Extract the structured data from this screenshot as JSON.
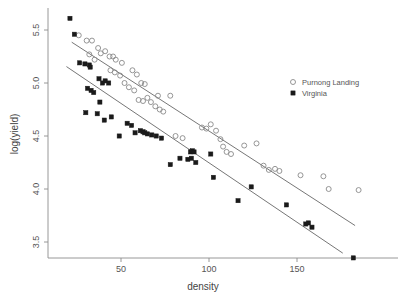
{
  "chart_data": {
    "type": "scatter",
    "title": "",
    "xlabel": "density",
    "ylabel": "log(yield)",
    "xlim": [
      18,
      188
    ],
    "ylim": [
      3.3,
      5.65
    ],
    "xticks": [
      50,
      100,
      150
    ],
    "xtick_labels": [
      "50",
      "100",
      "150"
    ],
    "yticks": [
      3.5,
      4.0,
      4.5,
      5.0,
      5.5
    ],
    "ytick_labels": [
      "3.5",
      "4.0",
      "4.5",
      "5.0",
      "5.5"
    ],
    "grid": false,
    "legend_position": "top-right",
    "series": [
      {
        "name": "Purnong Landing",
        "marker": "open-circle",
        "color": "#8a8a8a",
        "points": [
          [
            26.0,
            5.45
          ],
          [
            30.5,
            5.4
          ],
          [
            33.5,
            5.4
          ],
          [
            37.0,
            5.33
          ],
          [
            38.5,
            5.28
          ],
          [
            41.0,
            5.3
          ],
          [
            43.5,
            5.25
          ],
          [
            45.5,
            5.25
          ],
          [
            32.0,
            5.27
          ],
          [
            35.0,
            5.22
          ],
          [
            47.0,
            5.22
          ],
          [
            50.5,
            5.19
          ],
          [
            44.0,
            5.12
          ],
          [
            46.5,
            5.1
          ],
          [
            49.5,
            5.07
          ],
          [
            52.0,
            5.0
          ],
          [
            56.5,
            5.12
          ],
          [
            59.0,
            5.08
          ],
          [
            61.5,
            5.0
          ],
          [
            63.5,
            4.99
          ],
          [
            54.5,
            4.96
          ],
          [
            57.5,
            4.93
          ],
          [
            60.0,
            4.84
          ],
          [
            62.5,
            4.83
          ],
          [
            65.0,
            4.86
          ],
          [
            67.0,
            4.82
          ],
          [
            69.5,
            4.78
          ],
          [
            72.0,
            4.75
          ],
          [
            74.0,
            4.73
          ],
          [
            71.0,
            4.88
          ],
          [
            78.0,
            4.88
          ],
          [
            81.0,
            4.5
          ],
          [
            85.0,
            4.48
          ],
          [
            96.0,
            4.58
          ],
          [
            98.5,
            4.57
          ],
          [
            101.0,
            4.61
          ],
          [
            104.0,
            4.55
          ],
          [
            106.5,
            4.47
          ],
          [
            108.0,
            4.4
          ],
          [
            110.0,
            4.35
          ],
          [
            112.5,
            4.33
          ],
          [
            120.0,
            4.41
          ],
          [
            127.0,
            4.43
          ],
          [
            131.0,
            4.22
          ],
          [
            134.0,
            4.18
          ],
          [
            137.5,
            4.19
          ],
          [
            140.0,
            4.17
          ],
          [
            152.0,
            4.13
          ],
          [
            165.0,
            4.12
          ],
          [
            168.0,
            4.0
          ],
          [
            185.0,
            3.99
          ]
        ]
      },
      {
        "name": "Virginia",
        "marker": "filled-square",
        "color": "#1a1a1a",
        "points": [
          [
            21.0,
            5.61
          ],
          [
            23.5,
            5.46
          ],
          [
            26.5,
            5.19
          ],
          [
            29.5,
            5.18
          ],
          [
            32.0,
            5.17
          ],
          [
            32.5,
            5.15
          ],
          [
            31.0,
            4.95
          ],
          [
            33.0,
            4.93
          ],
          [
            34.5,
            4.91
          ],
          [
            30.0,
            4.72
          ],
          [
            37.5,
            5.04
          ],
          [
            39.5,
            5.0
          ],
          [
            41.0,
            5.02
          ],
          [
            43.0,
            5.0
          ],
          [
            38.0,
            4.82
          ],
          [
            40.5,
            4.65
          ],
          [
            36.5,
            4.71
          ],
          [
            44.5,
            4.68
          ],
          [
            49.0,
            4.5
          ],
          [
            53.5,
            4.62
          ],
          [
            56.0,
            4.6
          ],
          [
            58.0,
            4.53
          ],
          [
            61.0,
            4.55
          ],
          [
            62.5,
            4.54
          ],
          [
            63.5,
            4.53
          ],
          [
            65.0,
            4.52
          ],
          [
            67.5,
            4.51
          ],
          [
            70.0,
            4.5
          ],
          [
            73.0,
            4.48
          ],
          [
            78.0,
            4.23
          ],
          [
            83.5,
            4.29
          ],
          [
            88.0,
            4.28
          ],
          [
            90.0,
            4.29
          ],
          [
            92.5,
            4.25
          ],
          [
            89.5,
            4.35
          ],
          [
            90.5,
            4.36
          ],
          [
            91.5,
            4.35
          ],
          [
            101.0,
            4.33
          ],
          [
            102.5,
            4.11
          ],
          [
            116.5,
            3.89
          ],
          [
            124.0,
            4.02
          ],
          [
            144.0,
            3.85
          ],
          [
            155.0,
            3.67
          ],
          [
            156.5,
            3.68
          ],
          [
            158.5,
            3.64
          ],
          [
            182.0,
            3.35
          ]
        ]
      }
    ],
    "fit_lines": [
      {
        "name": "Purnong Landing",
        "color": "#666666",
        "x0": 22.0,
        "y0": 5.385,
        "x1": 183.0,
        "y1": 3.655
      },
      {
        "name": "Virginia",
        "color": "#666666",
        "x0": 19.0,
        "y0": 5.155,
        "x1": 176.0,
        "y1": 3.395
      }
    ],
    "legend": [
      {
        "label": "Purnong Landing",
        "marker": "open-circle"
      },
      {
        "label": "Virginia",
        "marker": "filled-square"
      }
    ]
  }
}
